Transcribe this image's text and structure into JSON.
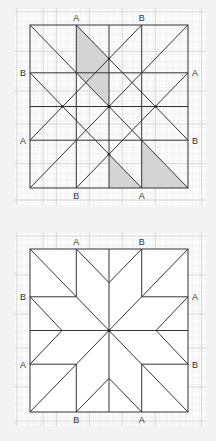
{
  "colors": {
    "page_background": "#f3f3f3",
    "grid_background": "#fbfbfb",
    "grid_minor": "#dedede",
    "grid_major": "#c8c8c8",
    "line": "#333333",
    "shade": "#d4d4d4",
    "label": "#333333",
    "star_fill": "#ffffff"
  },
  "labels": {
    "top_left": "A",
    "top_right": "B",
    "left_upper": "B",
    "left_lower": "A",
    "right_upper": "A",
    "right_lower": "B",
    "bottom_left": "B",
    "bottom_right": "A"
  },
  "figures": [
    {
      "id": "construction",
      "description": "Square with construction lines through points A and B; three shaded pieces",
      "shaded_regions": 3
    },
    {
      "id": "star",
      "description": "Eight-pointed star pattern inside square",
      "shaded_regions": 0
    }
  ]
}
